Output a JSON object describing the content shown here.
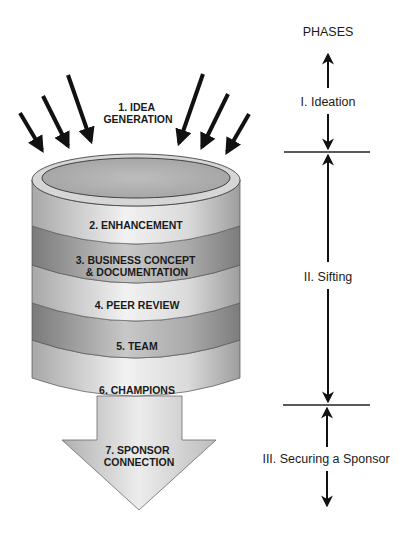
{
  "diagram": {
    "type": "funnel-cylinder-process",
    "phases_header": "PHASES",
    "input_label": [
      "1. IDEA",
      "GENERATION"
    ],
    "stages": [
      {
        "id": 2,
        "lines": [
          "2. ENHANCEMENT"
        ]
      },
      {
        "id": 3,
        "lines": [
          "3. BUSINESS CONCEPT",
          "& DOCUMENTATION"
        ]
      },
      {
        "id": 4,
        "lines": [
          "4. PEER REVIEW"
        ]
      },
      {
        "id": 5,
        "lines": [
          "5. TEAM"
        ]
      },
      {
        "id": 6,
        "lines": [
          "6. CHAMPIONS"
        ]
      }
    ],
    "output_label": [
      "7. SPONSOR",
      "CONNECTION"
    ],
    "phases": [
      {
        "label": "I. Ideation"
      },
      {
        "label": "II. Sifting"
      },
      {
        "label": "III. Securing a Sponsor"
      }
    ],
    "colors": {
      "band_light": "#d4d4d4",
      "band_dark": "#9a9a9a",
      "outline": "#3a3a3a",
      "arrow": "#111111",
      "text": "#1a1a1a"
    }
  }
}
